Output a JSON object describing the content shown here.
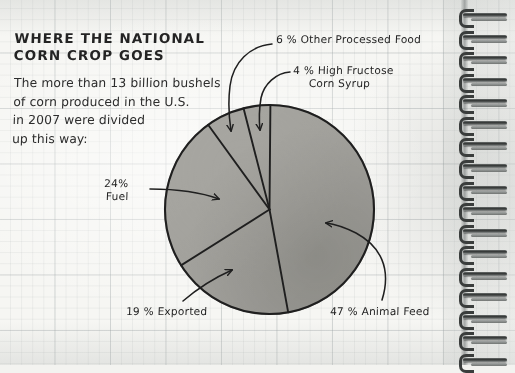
{
  "page": {
    "medium": "graph-paper-notebook",
    "binding": "spiral-wire",
    "coil_count": 17
  },
  "headline": {
    "line1": "WHERE THE NATIONAL",
    "line2": "CORN CROP GOES"
  },
  "body": {
    "line1": "The more than 13 billion bushels",
    "line2": "of corn produced in the U.S.",
    "line3": "in 2007 were divided",
    "line4": "up this way:"
  },
  "labels": {
    "other_processed_food": "6 % Other Processed Food",
    "hfcs_line1": "4 % High Fructose",
    "hfcs_line2": "Corn Syrup",
    "fuel_line1": "24%",
    "fuel_line2": "Fuel",
    "exported": "19 % Exported",
    "animal_feed": "47 % Animal Feed"
  },
  "colors": {
    "ink": "#1f1f1f",
    "paper": "#f6f6f3",
    "grid_line": "#969ea0",
    "kernel_fill": "#a9a69c",
    "wire": "#3a3d3c"
  },
  "chart_data": {
    "type": "pie",
    "title": "WHERE THE NATIONAL CORN CROP GOES",
    "subtitle": "The more than 13 billion bushels of corn produced in the U.S. in 2007 were divided up this way:",
    "unit": "percent",
    "total": 100,
    "legend_position": "callout-labels",
    "start_angle_deg": 0,
    "direction": "clockwise",
    "fill_style": "corn-kernel-photograph",
    "categories": [
      "Animal Feed",
      "Exported",
      "Fuel",
      "Other Processed Food",
      "High Fructose Corn Syrup"
    ],
    "values": [
      47,
      19,
      24,
      6,
      4
    ],
    "slices": [
      {
        "label": "Animal Feed",
        "value": 47,
        "display": "47 % Animal Feed",
        "start_deg": 0,
        "end_deg": 169.2
      },
      {
        "label": "Exported",
        "value": 19,
        "display": "19 % Exported",
        "start_deg": 169.2,
        "end_deg": 237.6
      },
      {
        "label": "Fuel",
        "value": 24,
        "display": "24% Fuel",
        "start_deg": 237.6,
        "end_deg": 324.0
      },
      {
        "label": "Other Processed Food",
        "value": 6,
        "display": "6 % Other Processed Food",
        "start_deg": 324.0,
        "end_deg": 345.6
      },
      {
        "label": "High Fructose Corn Syrup",
        "value": 4,
        "display": "4 % High Fructose Corn Syrup",
        "start_deg": 345.6,
        "end_deg": 360.0
      }
    ],
    "annotations": [
      {
        "text": "13 billion bushels",
        "note": "total U.S. corn production"
      },
      {
        "text": "2007",
        "note": "year of data"
      }
    ]
  }
}
